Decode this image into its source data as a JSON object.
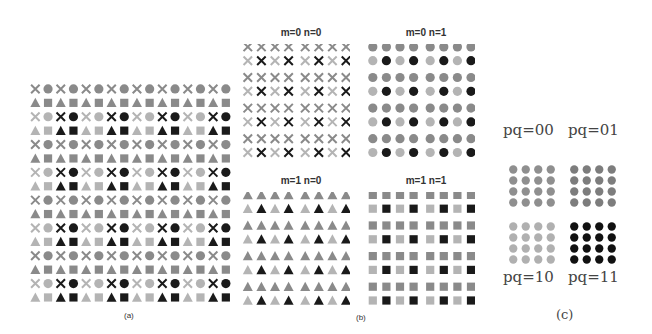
{
  "figure": {
    "panels": {
      "a": {
        "caption": "(a)",
        "columns": 16,
        "rows": 16,
        "tile_pattern": [
          [
            "x",
            "circle"
          ],
          [
            "triangle",
            "square"
          ]
        ],
        "description": "Interleaved 2x2 tiles of cross, circle, triangle, square; every other tile-row has lighter left tile and dark right tile"
      },
      "b": {
        "caption": "(b)",
        "subpanels": [
          {
            "title": "m=0 n=0",
            "shape": "x"
          },
          {
            "title": "m=0 n=1",
            "shape": "circle"
          },
          {
            "title": "m=1 n=0",
            "shape": "triangle"
          },
          {
            "title": "m=1 n=1",
            "shape": "square"
          }
        ],
        "columns": 8,
        "rows": 8
      },
      "c": {
        "caption": "(c)",
        "subpanels": [
          {
            "label": "pq=00",
            "tone": "#8f8f8f"
          },
          {
            "label": "pq=01",
            "tone": "#7d7d7d"
          },
          {
            "label": "pq=10",
            "tone": "#b0b0b0"
          },
          {
            "label": "pq=11",
            "tone": "#111111"
          }
        ],
        "columns": 4,
        "rows": 4
      }
    },
    "colors": {
      "mid_gray": "#8a8a8a",
      "light_gray": "#b4b4b4",
      "dark": "#1a1a1a"
    }
  }
}
